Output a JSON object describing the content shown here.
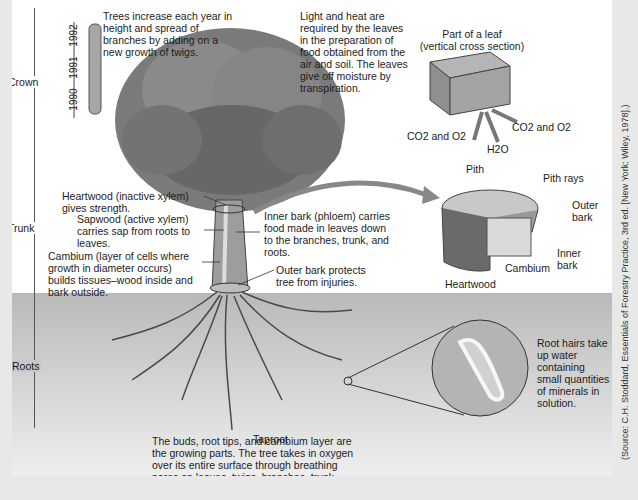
{
  "sections": {
    "crown": "Crown",
    "trunk": "Trunk",
    "roots": "Roots"
  },
  "twig_years": [
    "1992",
    "1991",
    "1990"
  ],
  "annotations": {
    "crown_growth": "Trees increase each year in height and spread of branches by adding on a new growth of twigs.",
    "leaves": "Light and heat are required by the leaves in the preparation of food obtained from the air and soil. The leaves give off moisture by transpiration.",
    "leaf_title": "Part of a leaf",
    "leaf_subtitle": "(vertical cross section)",
    "gas_in": "CO2 and O2",
    "gas_out": "CO2 and O2",
    "water": "H2O",
    "heartwood": "Heartwood (inactive xylem) gives strength.",
    "sapwood": "Sapwood (active xylem) carries sap from roots to leaves.",
    "cambium": "Cambium (layer of cells where growth in diameter occurs) builds tissues–wood inside and bark outside.",
    "inner_bark": "Inner bark (phloem) carries food made in leaves down to the branches, trunk, and roots.",
    "outer_bark": "Outer bark protects tree from injuries.",
    "taproot": "Taproot",
    "root_hairs": "Root hairs take up water containing small quantities of minerals in solution.",
    "growing_parts": "The buds, root tips, and cambium layer are the growing parts. The tree takes in oxygen over its entire surface through breathing pores on leaves, twigs, branches, trunk, and roots."
  },
  "cross_section_labels": {
    "pith": "Pith",
    "pith_rays": "Pith rays",
    "outer_bark": "Outer bark",
    "inner_bark": "Inner bark",
    "cambium": "Cambium",
    "heartwood": "Heartwood"
  },
  "source_credit": "(Source: C.H. Stoddard, Essentials of Forestry Practice, 3rd ed. [New York: Wiley, 1978].)"
}
